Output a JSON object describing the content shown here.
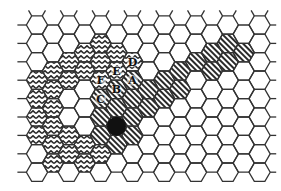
{
  "diagram": {
    "type": "hexagonal-grid",
    "width": 281,
    "height": 191,
    "colors": {
      "grid_line": "#333333",
      "background": "#ffffff",
      "pattern_ink": "#2a2a2a",
      "agent_dot": "#111111"
    },
    "grid": {
      "columns": 15,
      "origin_x": 37,
      "col_step": 15.9,
      "even_col_first_y": 25,
      "odd_col_first_y": 34.2,
      "row_step": 18.4,
      "even_rows": 9,
      "odd_rows": 8,
      "hex_radius": 10.6
    },
    "cells": [
      {
        "c": 4,
        "r": 1,
        "fill": "zigzag"
      },
      {
        "c": 3,
        "r": 1,
        "fill": "zigzag"
      },
      {
        "c": 5,
        "r": 1,
        "fill": "zigzag"
      },
      {
        "c": 2,
        "r": 2,
        "fill": "zigzag"
      },
      {
        "c": 4,
        "r": 2,
        "fill": "zigzag"
      },
      {
        "c": 6,
        "r": 2,
        "fill": "zigzag",
        "label": "D"
      },
      {
        "c": 1,
        "r": 2,
        "fill": "zigzag"
      },
      {
        "c": 3,
        "r": 2,
        "fill": "zigzag"
      },
      {
        "c": 5,
        "r": 2,
        "fill": "zigzag",
        "label": "E"
      },
      {
        "c": 0,
        "r": 3,
        "fill": "zigzag"
      },
      {
        "c": 2,
        "r": 3,
        "fill": "zigzag"
      },
      {
        "c": 4,
        "r": 3,
        "fill": "zigzag",
        "label": "F"
      },
      {
        "c": 6,
        "r": 3,
        "fill": "diagonal",
        "label": "A"
      },
      {
        "c": 1,
        "r": 3,
        "fill": "zigzag"
      },
      {
        "c": 5,
        "r": 3,
        "fill": "diagonal",
        "label": "B"
      },
      {
        "c": 0,
        "r": 4,
        "fill": "zigzag"
      },
      {
        "c": 4,
        "r": 4,
        "fill": "diagonal",
        "label": "C"
      },
      {
        "c": 6,
        "r": 4,
        "fill": "diagonal"
      },
      {
        "c": 1,
        "r": 4,
        "fill": "zigzag"
      },
      {
        "c": 5,
        "r": 4,
        "fill": "diagonal"
      },
      {
        "c": 0,
        "r": 5,
        "fill": "zigzag"
      },
      {
        "c": 4,
        "r": 5,
        "fill": "diagonal"
      },
      {
        "c": 6,
        "r": 5,
        "fill": "diagonal"
      },
      {
        "c": 1,
        "r": 5,
        "fill": "zigzag"
      },
      {
        "c": 5,
        "r": 5,
        "fill": "diagonal",
        "agent": true
      },
      {
        "c": 0,
        "r": 6,
        "fill": "zigzag"
      },
      {
        "c": 2,
        "r": 6,
        "fill": "zigzag"
      },
      {
        "c": 4,
        "r": 6,
        "fill": "diagonal"
      },
      {
        "c": 6,
        "r": 6,
        "fill": "diagonal"
      },
      {
        "c": 1,
        "r": 6,
        "fill": "zigzag"
      },
      {
        "c": 3,
        "r": 6,
        "fill": "zigzag"
      },
      {
        "c": 5,
        "r": 6,
        "fill": "diagonal"
      },
      {
        "c": 2,
        "r": 7,
        "fill": "zigzag"
      },
      {
        "c": 4,
        "r": 7,
        "fill": "zigzag"
      },
      {
        "c": 1,
        "r": 7,
        "fill": "zigzag"
      },
      {
        "c": 3,
        "r": 7,
        "fill": "zigzag"
      },
      {
        "c": 7,
        "r": 3,
        "fill": "diagonal"
      },
      {
        "c": 7,
        "r": 4,
        "fill": "diagonal"
      },
      {
        "c": 8,
        "r": 3,
        "fill": "diagonal"
      },
      {
        "c": 8,
        "r": 4,
        "fill": "diagonal"
      },
      {
        "c": 9,
        "r": 2,
        "fill": "diagonal"
      },
      {
        "c": 9,
        "r": 3,
        "fill": "diagonal"
      },
      {
        "c": 10,
        "r": 2,
        "fill": "diagonal"
      },
      {
        "c": 11,
        "r": 1,
        "fill": "diagonal"
      },
      {
        "c": 11,
        "r": 2,
        "fill": "diagonal"
      },
      {
        "c": 12,
        "r": 1,
        "fill": "diagonal"
      },
      {
        "c": 12,
        "r": 2,
        "fill": "diagonal"
      },
      {
        "c": 13,
        "r": 1,
        "fill": "diagonal"
      }
    ],
    "labels": [
      "A",
      "B",
      "C",
      "D",
      "E",
      "F"
    ]
  }
}
